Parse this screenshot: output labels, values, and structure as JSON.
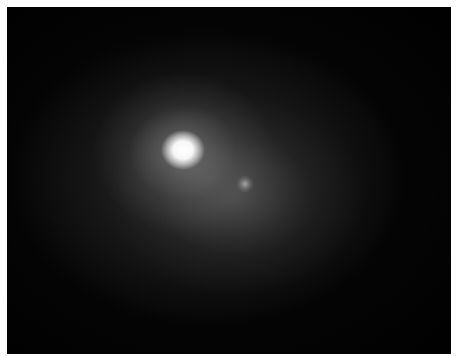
{
  "image": {
    "description": "Grayscale low-resolution astronomical image: bright saturated point source with diffuse halo and a faint secondary source",
    "colors": {
      "border": "#ffffff",
      "background": "#050505",
      "core": "#ffffff",
      "halo": "#787878"
    },
    "features": [
      {
        "name": "bright-core",
        "x": 183,
        "y": 150
      },
      {
        "name": "faint-secondary-source",
        "x": 245,
        "y": 184
      }
    ]
  }
}
